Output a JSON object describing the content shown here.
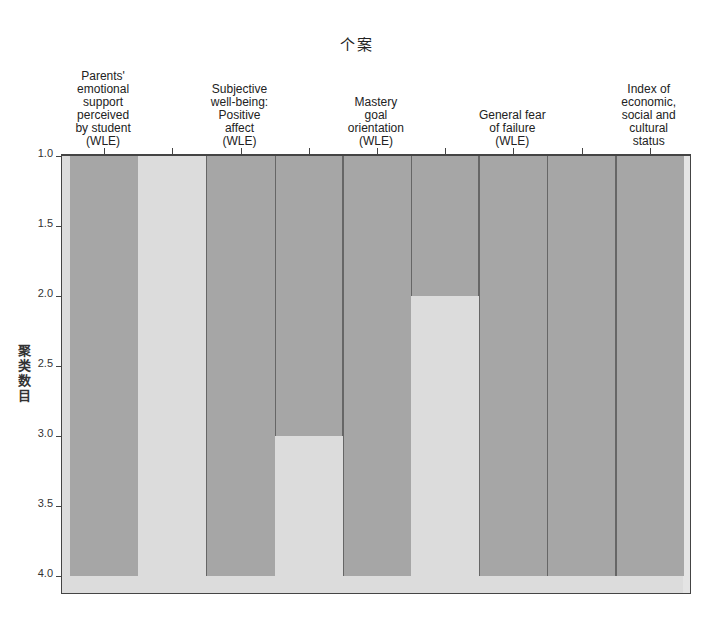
{
  "chart_data": {
    "type": "icicle",
    "title": "个案",
    "xlabel": "个案",
    "ylabel": "聚类数目",
    "y_axis": {
      "ticks": [
        "1.0",
        "1.5",
        "2.0",
        "2.5",
        "3.0",
        "3.5",
        "4.0"
      ],
      "range": [
        1.0,
        4.0
      ],
      "inverted": true
    },
    "cases": [
      "Parents' emotional support perceived by student (WLE)",
      "Subjective well-being: Positive affect (WLE)",
      "Mastery goal orientation (WLE)",
      "General fear of failure (WLE)",
      "Index of economic, social and cultural status"
    ],
    "case_label_lines": [
      [
        "Parents'",
        "emotional",
        "support",
        "perceived",
        "by student",
        "(WLE)"
      ],
      [
        "Subjective",
        "well-being:",
        "Positive",
        "affect",
        "(WLE)"
      ],
      [
        "Mastery",
        "goal",
        "orientation",
        "(WLE)"
      ],
      [
        "General fear",
        "of failure",
        "(WLE)"
      ],
      [
        "Index of",
        "economic,",
        "social and",
        "cultural",
        "status"
      ]
    ],
    "gaps": [
      {
        "between": [
          1,
          2
        ],
        "joined_until_clusters": 1.0
      },
      {
        "between": [
          2,
          3
        ],
        "joined_until_clusters": 3.0
      },
      {
        "between": [
          3,
          4
        ],
        "joined_until_clusters": 2.0
      },
      {
        "between": [
          4,
          5
        ],
        "joined_until_clusters": 4.0
      }
    ],
    "colors": {
      "bar": "#a6a6a6",
      "background": "#dcdcdc",
      "frame": "#444444"
    }
  }
}
